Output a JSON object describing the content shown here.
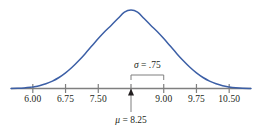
{
  "chart_data": {
    "type": "line",
    "title": "",
    "subtitle": "",
    "xlabel": "",
    "ylabel": "",
    "distribution": "normal",
    "mean": 8.25,
    "sigma": 0.75,
    "xlim": [
      5.5,
      11.0
    ],
    "ylim": [
      0,
      1
    ],
    "grid": false,
    "legend": null,
    "curve_color": "#3c5fa6",
    "axis_color": "#7f7f7f",
    "text_color": "#231f20",
    "x_ticks": [
      6.0,
      6.75,
      7.5,
      8.25,
      9.0,
      9.75,
      10.5
    ],
    "tick_labels": [
      "6.00",
      "6.75",
      "7.50",
      "",
      "9.00",
      "9.75",
      "10.50"
    ],
    "annotations": [
      {
        "name": "sigma-annotation",
        "symbol": "σ",
        "equals": " = ",
        "value": ".75",
        "text": "σ = .75",
        "span_from": 8.25,
        "span_to": 9.0
      },
      {
        "name": "mu-annotation",
        "symbol": "μ",
        "equals": " = ",
        "value": "8.25",
        "text": "μ = 8.25",
        "points_to": 8.25
      }
    ],
    "curve_points": [
      [
        5.5,
        0.001
      ],
      [
        5.65,
        0.003
      ],
      [
        5.8,
        0.007
      ],
      [
        5.95,
        0.015
      ],
      [
        6.0,
        0.02
      ],
      [
        6.15,
        0.035
      ],
      [
        6.3,
        0.06
      ],
      [
        6.45,
        0.094
      ],
      [
        6.6,
        0.14
      ],
      [
        6.75,
        0.199
      ],
      [
        6.9,
        0.27
      ],
      [
        7.05,
        0.353
      ],
      [
        7.2,
        0.444
      ],
      [
        7.35,
        0.54
      ],
      [
        7.5,
        0.636
      ],
      [
        7.65,
        0.726
      ],
      [
        7.8,
        0.806
      ],
      [
        7.95,
        0.891
      ],
      [
        8.1,
        0.973
      ],
      [
        8.25,
        1.0
      ],
      [
        8.4,
        0.973
      ],
      [
        8.55,
        0.891
      ],
      [
        8.7,
        0.806
      ],
      [
        8.85,
        0.726
      ],
      [
        9.0,
        0.636
      ],
      [
        9.15,
        0.54
      ],
      [
        9.3,
        0.444
      ],
      [
        9.45,
        0.353
      ],
      [
        9.6,
        0.27
      ],
      [
        9.75,
        0.199
      ],
      [
        9.9,
        0.14
      ],
      [
        10.05,
        0.094
      ],
      [
        10.2,
        0.06
      ],
      [
        10.35,
        0.035
      ],
      [
        10.5,
        0.02
      ],
      [
        10.65,
        0.01
      ],
      [
        10.8,
        0.004
      ],
      [
        11.0,
        0.001
      ]
    ]
  },
  "figure": {
    "name": "normal-distribution-curve"
  }
}
